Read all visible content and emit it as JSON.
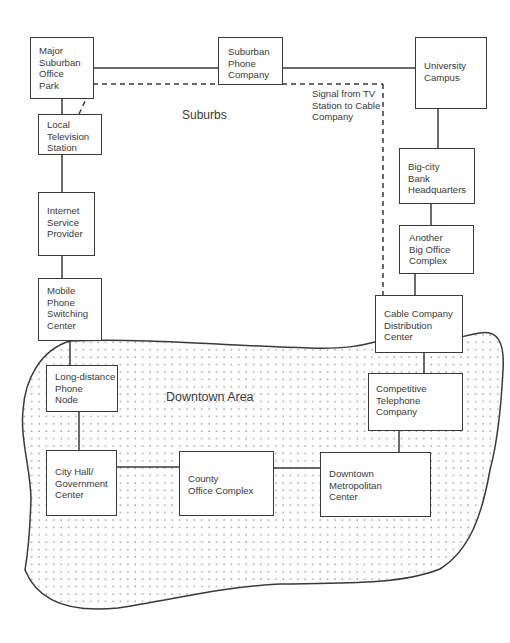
{
  "diagram": {
    "regions": {
      "suburbs": {
        "label": "Suburbs"
      },
      "downtown": {
        "label": "Downtown Area"
      }
    },
    "annotation": {
      "signal": "Signal from TV\nStation to Cable\nCompany"
    },
    "nodes": {
      "office_park": {
        "label": "Major\nSuburban\nOffice\nPark"
      },
      "suburban_phone": {
        "label": "Suburban\nPhone\nCompany"
      },
      "university": {
        "label": "University\nCampus"
      },
      "local_tv": {
        "label": "Local\nTelevision\nStation"
      },
      "isp": {
        "label": "Internet\nService\nProvider"
      },
      "mobile_switch": {
        "label": "Mobile\nPhone\nSwitching\nCenter"
      },
      "bank_hq": {
        "label": "Big-city\nBank\nHeadquarters"
      },
      "big_office": {
        "label": "Another\nBig Office\nComplex"
      },
      "cable_dist": {
        "label": "Cable Company\nDistribution\nCenter"
      },
      "long_distance": {
        "label": "Long-distance\nPhone\nNode"
      },
      "competitive_tel": {
        "label": "Competitive\nTelephone\nCompany"
      },
      "city_hall": {
        "label": "City Hall/\nGovernment\nCenter"
      },
      "county_office": {
        "label": "County\nOffice Complex"
      },
      "downtown_metro": {
        "label": "Downtown\nMetropolitan\nCenter"
      }
    },
    "links": [
      {
        "from": "office_park",
        "to": "suburban_phone",
        "style": "solid"
      },
      {
        "from": "suburban_phone",
        "to": "university",
        "style": "solid"
      },
      {
        "from": "office_park",
        "to": "local_tv",
        "style": "solid"
      },
      {
        "from": "local_tv",
        "to": "isp",
        "style": "solid"
      },
      {
        "from": "isp",
        "to": "mobile_switch",
        "style": "solid"
      },
      {
        "from": "mobile_switch",
        "to": "long_distance",
        "style": "solid"
      },
      {
        "from": "long_distance",
        "to": "city_hall",
        "style": "solid"
      },
      {
        "from": "city_hall",
        "to": "county_office",
        "style": "solid"
      },
      {
        "from": "county_office",
        "to": "downtown_metro",
        "style": "solid"
      },
      {
        "from": "downtown_metro",
        "to": "competitive_tel",
        "style": "solid"
      },
      {
        "from": "competitive_tel",
        "to": "cable_dist",
        "style": "solid"
      },
      {
        "from": "cable_dist",
        "to": "big_office",
        "style": "solid"
      },
      {
        "from": "big_office",
        "to": "bank_hq",
        "style": "solid"
      },
      {
        "from": "bank_hq",
        "to": "university",
        "style": "solid"
      },
      {
        "from": "local_tv",
        "to": "cable_dist",
        "style": "dashed",
        "label": "Signal from TV Station to Cable Company"
      }
    ],
    "colors": {
      "line": "#3a3a3a",
      "dots": "#8a8a8a",
      "background": "#ffffff"
    }
  }
}
